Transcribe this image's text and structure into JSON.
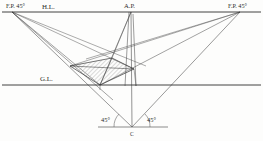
{
  "figure": {
    "background_color": "#fdfdfc",
    "line_color": "#3a3a3a",
    "hatch_color": "#9a9a9a",
    "text_color": "#2b2b2b",
    "width": 263,
    "height": 141
  },
  "labels": {
    "left_vanishing_point": "F.P. 45°",
    "horizon_line": "H.L.",
    "axis_point": "A.P.",
    "right_vanishing_point": "F.P. 45°",
    "ground_line": "G.L.",
    "left_angle": "45°",
    "right_angle": "45°",
    "station_point": "C"
  },
  "reference_lines": [
    {
      "name": "horizon-line",
      "label": "H.L.",
      "y": 12,
      "x1": 2,
      "x2": 261
    },
    {
      "name": "ground-line",
      "label": "G.L.",
      "y": 85,
      "x1": 2,
      "x2": 261
    },
    {
      "name": "station-baseline",
      "label": "",
      "y": 127,
      "x1": 98,
      "x2": 168
    }
  ],
  "points": {
    "left_fp": {
      "x": 12,
      "y": 12
    },
    "right_fp": {
      "x": 240,
      "y": 12
    },
    "ap": {
      "x": 131,
      "y": 12
    },
    "station_c": {
      "x": 132,
      "y": 127
    }
  },
  "object_polygon": {
    "name": "hatched-top-face",
    "vertices": [
      {
        "x": 70,
        "y": 66
      },
      {
        "x": 112,
        "y": 58
      },
      {
        "x": 134,
        "y": 69
      },
      {
        "x": 100,
        "y": 85
      }
    ]
  },
  "angles": {
    "left_degrees": 45,
    "right_degrees": 45
  }
}
